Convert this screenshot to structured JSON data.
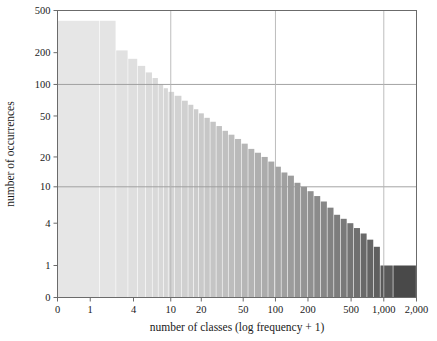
{
  "chart_data": {
    "type": "bar",
    "title": "",
    "subtitle": "",
    "xlabel": "number of classes (log frequency + 1)",
    "ylabel": "number of occurrences",
    "grid": true,
    "legend": null,
    "x_scale": "log-like (log frequency + 1)",
    "y_scale": "log-like (log occurrences)",
    "x_tick_labels": [
      "0",
      "1",
      "4",
      "10",
      "20",
      "50",
      "100",
      "200",
      "500",
      "1,000",
      "2,000"
    ],
    "x_tick_values": [
      0,
      1,
      4,
      10,
      20,
      50,
      100,
      200,
      500,
      1000,
      2000
    ],
    "y_tick_labels": [
      "0",
      "1",
      "4",
      "10",
      "20",
      "50",
      "100",
      "200",
      "500"
    ],
    "y_tick_values": [
      0,
      1,
      4,
      10,
      20,
      50,
      100,
      200,
      500
    ],
    "ylim": [
      0,
      500
    ],
    "xlim": [
      0,
      2000
    ],
    "gridlines_horizontal_at": [
      10,
      100
    ],
    "gridlines_vertical_at": [
      10,
      100,
      1000
    ],
    "bar_color_light": "#e8e8e8",
    "bar_color_mid": "#8a8a8a",
    "bar_color_dark": "#3d3d3d",
    "categories": [
      1,
      2,
      3,
      4,
      5,
      6,
      7,
      8,
      9,
      10,
      12,
      14,
      16,
      18,
      20,
      23,
      26,
      30,
      34,
      39,
      45,
      52,
      60,
      69,
      80,
      92,
      106,
      122,
      140,
      161,
      185,
      213,
      245,
      282,
      325,
      374,
      430,
      495,
      570,
      656,
      755,
      869,
      1000,
      1500
    ],
    "values": [
      400,
      400,
      210,
      175,
      150,
      130,
      115,
      100,
      92,
      85,
      78,
      70,
      64,
      58,
      53,
      48,
      44,
      40,
      36,
      33,
      30,
      27,
      24,
      22,
      20,
      18,
      16,
      14,
      13,
      11,
      10,
      9,
      8,
      7,
      6,
      5,
      4.5,
      4,
      3.5,
      3,
      2.5,
      2,
      1,
      1
    ]
  }
}
